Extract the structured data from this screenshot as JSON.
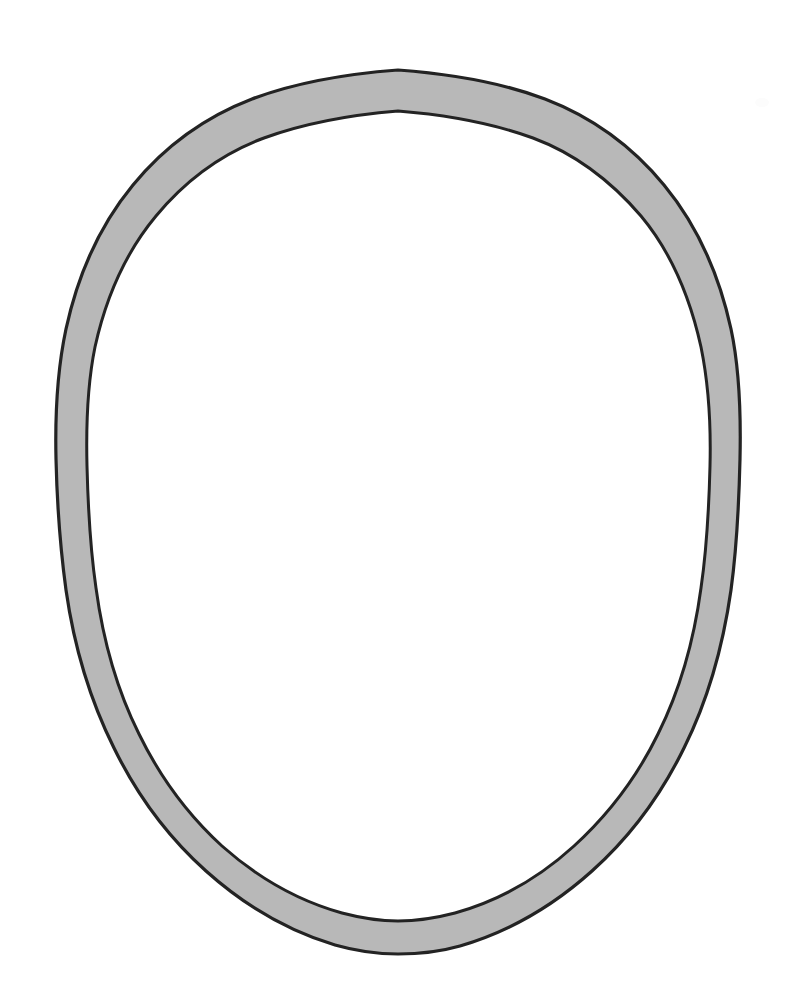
{
  "canvas": {
    "width": 791,
    "height": 999,
    "background_color": "#ffffff",
    "title": "Oval ring outline drawing"
  },
  "figure": {
    "name": "oval-ring",
    "shape_type": "annulus-ellipse",
    "band_fill_color": "#b8b8b8",
    "outline_color": "#232323",
    "outline_width_px": 3,
    "interior_fill_color": "#ffffff",
    "outer_ellipse": {
      "center_x": 398,
      "center_y": 512,
      "radius_x": 342,
      "radius_y": 442,
      "left": 56,
      "right": 740,
      "top": 70,
      "bottom": 954
    },
    "inner_ellipse": {
      "center_x": 398,
      "center_y": 512,
      "radius_x": 302,
      "radius_y": 401,
      "left": 96,
      "right": 700,
      "top": 111,
      "bottom": 913
    },
    "band_thickness_px": 40,
    "apex_cusp_top": true,
    "apex_cusp_bottom": true,
    "edge_quality": "irregular hand-drawn / scanned"
  },
  "artifacts": {
    "faint_smudge": {
      "name": "faint-smudge",
      "x": 755,
      "y": 98,
      "color": "#fbfbfb"
    }
  },
  "chart_data": {
    "type": "scatter",
    "xlabel": "",
    "ylabel": "",
    "x": [],
    "values": [],
    "categories": [],
    "note": "Not a chart; a single closed ring-shaped contour figure."
  }
}
